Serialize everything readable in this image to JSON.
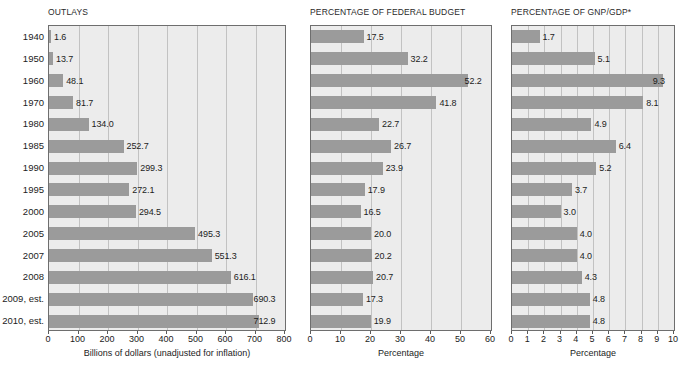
{
  "figure": {
    "categories": [
      "1940",
      "1950",
      "1960",
      "1970",
      "1980",
      "1985",
      "1990",
      "1995",
      "2000",
      "2005",
      "2007",
      "2008",
      "2009, est.",
      "2010, est."
    ],
    "bar_color": "#9b9b9b",
    "plot_background": "#ececec",
    "grid_color": "#c2c2c2",
    "frame_color": "#6e6e6e"
  },
  "chart_data": [
    {
      "type": "bar",
      "orientation": "horizontal",
      "title": "OUTLAYS",
      "xlabel": "Billions of dollars (unadjusted for inflation)",
      "ylabel": "",
      "categories": [
        "1940",
        "1950",
        "1960",
        "1970",
        "1980",
        "1985",
        "1990",
        "1995",
        "2000",
        "2005",
        "2007",
        "2008",
        "2009, est.",
        "2010, est."
      ],
      "values": [
        1.6,
        13.7,
        48.1,
        81.7,
        134.0,
        252.7,
        299.3,
        272.1,
        294.5,
        495.3,
        551.3,
        616.1,
        690.3,
        712.9
      ],
      "value_labels": [
        "1.6",
        "13.7",
        "48.1",
        "81.7",
        "134.0",
        "252.7",
        "299.3",
        "272.1",
        "294.5",
        "495.3",
        "551.3",
        "616.1",
        "690.3",
        "712.9"
      ],
      "xlim": [
        0,
        800
      ],
      "xticks": [
        0,
        100,
        200,
        300,
        400,
        500,
        600,
        700,
        800
      ],
      "xticklabels": [
        "0",
        "100",
        "200",
        "300",
        "400",
        "500",
        "600",
        "700",
        "800"
      ],
      "grid": true,
      "legend": "none"
    },
    {
      "type": "bar",
      "orientation": "horizontal",
      "title": "PERCENTAGE OF FEDERAL BUDGET",
      "xlabel": "Percentage",
      "ylabel": "",
      "categories": [
        "1940",
        "1950",
        "1960",
        "1970",
        "1980",
        "1985",
        "1990",
        "1995",
        "2000",
        "2005",
        "2007",
        "2008",
        "2009, est.",
        "2010, est."
      ],
      "values": [
        17.5,
        32.2,
        52.2,
        41.8,
        22.7,
        26.7,
        23.9,
        17.9,
        16.5,
        20.0,
        20.2,
        20.7,
        17.3,
        19.9
      ],
      "value_labels": [
        "17.5",
        "32.2",
        "52.2",
        "41.8",
        "22.7",
        "26.7",
        "23.9",
        "17.9",
        "16.5",
        "20.0",
        "20.2",
        "20.7",
        "17.3",
        "19.9"
      ],
      "xlim": [
        0,
        60
      ],
      "xticks": [
        0,
        10,
        20,
        30,
        40,
        50,
        60
      ],
      "xticklabels": [
        "0",
        "10",
        "20",
        "30",
        "40",
        "50",
        "60"
      ],
      "grid": true,
      "legend": "none"
    },
    {
      "type": "bar",
      "orientation": "horizontal",
      "title": "PERCENTAGE OF GNP/GDP*",
      "xlabel": "Percentage",
      "ylabel": "",
      "categories": [
        "1940",
        "1950",
        "1960",
        "1970",
        "1980",
        "1985",
        "1990",
        "1995",
        "2000",
        "2005",
        "2007",
        "2008",
        "2009, est.",
        "2010, est."
      ],
      "values": [
        1.7,
        5.1,
        9.3,
        8.1,
        4.9,
        6.4,
        5.2,
        3.7,
        3.0,
        4.0,
        4.0,
        4.3,
        4.8,
        4.8
      ],
      "value_labels": [
        "1.7",
        "5.1",
        "9.3",
        "8.1",
        "4.9",
        "6.4",
        "5.2",
        "3.7",
        "3.0",
        "4.0",
        "4.0",
        "4.3",
        "4.8",
        "4.8"
      ],
      "xlim": [
        0,
        10
      ],
      "xticks": [
        0,
        1,
        2,
        3,
        4,
        5,
        6,
        7,
        8,
        9,
        10
      ],
      "xticklabels": [
        "0",
        "1",
        "2",
        "3",
        "4",
        "5",
        "6",
        "7",
        "8",
        "9",
        "10"
      ],
      "grid": true,
      "legend": "none"
    }
  ]
}
